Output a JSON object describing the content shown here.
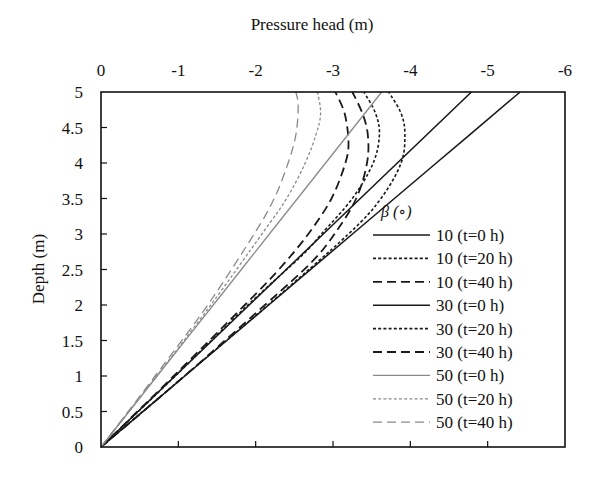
{
  "chart_data": {
    "type": "line",
    "title": "",
    "xlabel": "Pressure head  (m)",
    "ylabel": "Depth (m)",
    "xlim": [
      0,
      -6
    ],
    "ylim": [
      0,
      5
    ],
    "x_ticks": [
      "0",
      "-1",
      "-2",
      "-3",
      "-4",
      "-5",
      "-6"
    ],
    "y_ticks": [
      "0",
      "0.5",
      "1",
      "1.5",
      "2",
      "2.5",
      "3",
      "3.5",
      "4",
      "4.5",
      "5"
    ],
    "x_axis_position": "top",
    "grid": false,
    "legend_title": "β (∘)",
    "legend_position": "lower right inside",
    "series": [
      {
        "name": "10 (t=0 h)",
        "style": "solid",
        "color": "#1a1a1a",
        "width": 1.6,
        "depth": [
          0,
          1,
          2,
          3,
          4,
          5
        ],
        "pressure_head": [
          0,
          -1.084,
          -2.168,
          -3.252,
          -4.336,
          -5.42
        ]
      },
      {
        "name": "10 (t=20 h)",
        "style": "dotted",
        "color": "#1a1a1a",
        "width": 1.6,
        "depth": [
          0,
          1,
          2,
          3,
          3.5,
          4.0,
          4.4,
          4.7,
          5
        ],
        "pressure_head": [
          0,
          -1.08,
          -2.16,
          -3.2,
          -3.62,
          -3.88,
          -3.93,
          -3.88,
          -3.72
        ]
      },
      {
        "name": "10 (t=40 h)",
        "style": "dashed",
        "color": "#1a1a1a",
        "width": 1.8,
        "depth": [
          0,
          1,
          2,
          2.6,
          3,
          3.5,
          4.0,
          4.4,
          4.7,
          5
        ],
        "pressure_head": [
          0,
          -1.08,
          -2.12,
          -2.72,
          -3.02,
          -3.3,
          -3.44,
          -3.45,
          -3.38,
          -3.25
        ]
      },
      {
        "name": "30 (t=0 h)",
        "style": "solid",
        "color": "#1a1a1a",
        "width": 1.6,
        "depth": [
          0,
          1,
          2,
          3,
          4,
          5
        ],
        "pressure_head": [
          0,
          -0.958,
          -1.916,
          -2.874,
          -3.832,
          -4.79
        ]
      },
      {
        "name": "30 (t=20 h)",
        "style": "dotted",
        "color": "#1a1a1a",
        "width": 1.6,
        "depth": [
          0,
          1,
          2,
          2.7,
          3,
          3.5,
          4.0,
          4.4,
          4.7,
          5
        ],
        "pressure_head": [
          0,
          -0.96,
          -1.9,
          -2.6,
          -2.85,
          -3.25,
          -3.52,
          -3.6,
          -3.55,
          -3.4
        ]
      },
      {
        "name": "30 (t=40 h)",
        "style": "dashed",
        "color": "#1a1a1a",
        "width": 1.8,
        "depth": [
          0,
          1,
          2,
          2.5,
          3,
          3.5,
          4.0,
          4.3,
          4.7,
          5
        ],
        "pressure_head": [
          0,
          -0.94,
          -1.86,
          -2.3,
          -2.68,
          -2.98,
          -3.16,
          -3.2,
          -3.15,
          -3.03
        ]
      },
      {
        "name": "50 (t=0 h)",
        "style": "solid",
        "color": "#8a8a8a",
        "width": 1.3,
        "depth": [
          0,
          1,
          2,
          3,
          4,
          5
        ],
        "pressure_head": [
          0,
          -0.726,
          -1.452,
          -2.178,
          -2.904,
          -3.63
        ]
      },
      {
        "name": "50 (t=20 h)",
        "style": "dotted",
        "color": "#8a8a8a",
        "width": 1.3,
        "depth": [
          0,
          1,
          2,
          3,
          3.5,
          4.0,
          4.4,
          4.7,
          5
        ],
        "pressure_head": [
          0,
          -0.72,
          -1.42,
          -2.08,
          -2.4,
          -2.64,
          -2.78,
          -2.84,
          -2.8
        ]
      },
      {
        "name": "50 (t=40 h)",
        "style": "dashed",
        "color": "#8a8a8a",
        "width": 1.3,
        "depth": [
          0,
          1,
          2,
          3,
          3.5,
          4.0,
          4.4,
          4.8,
          5
        ],
        "pressure_head": [
          0,
          -0.7,
          -1.38,
          -1.98,
          -2.24,
          -2.42,
          -2.52,
          -2.55,
          -2.52
        ]
      }
    ]
  },
  "plot_area": {
    "left": 101,
    "top": 92,
    "right": 565,
    "bottom": 447
  }
}
